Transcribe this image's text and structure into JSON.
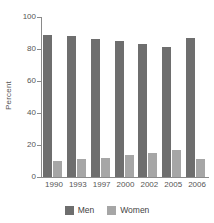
{
  "chart_data": {
    "type": "bar",
    "title": "",
    "subtitle": "",
    "xlabel": "",
    "ylabel": "Percent",
    "categories": [
      "1990",
      "1993",
      "1997",
      "2000",
      "2002",
      "2005",
      "2006"
    ],
    "series": [
      {
        "name": "Men",
        "color": "#6e6e6e",
        "values": [
          89,
          88,
          86,
          85,
          83,
          81,
          87
        ]
      },
      {
        "name": "Women",
        "color": "#a6a6a6",
        "values": [
          10,
          11,
          12,
          14,
          15,
          17,
          11
        ]
      }
    ],
    "ylim": [
      0,
      100
    ],
    "yticks": [
      0,
      20,
      40,
      60,
      80,
      100
    ],
    "ytick_labels": [
      "0",
      "20",
      "40",
      "60",
      "80",
      "100"
    ],
    "grid": false,
    "legend_position": "bottom"
  },
  "axes": {
    "y_title": "Percent"
  },
  "legend": {
    "entries": [
      {
        "label": "Men",
        "swatch": "men-swatch"
      },
      {
        "label": "Women",
        "swatch": "women-swatch"
      }
    ]
  },
  "colors": {
    "men": "#6e6e6e",
    "women": "#a6a6a6",
    "axis": "#8a8a8a",
    "text": "#555555",
    "background": "#ffffff"
  }
}
